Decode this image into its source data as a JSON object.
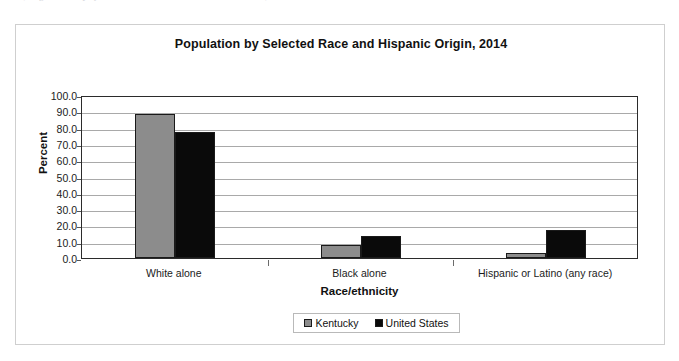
{
  "page": {
    "clipped_header_text": "(Image: Kentucky QuickFacts — U.S. Census Bureau selected data)"
  },
  "chart_data": {
    "type": "bar",
    "title": "Population by Selected Race and Hispanic Origin, 2014",
    "xlabel": "Race/ethnicity",
    "ylabel": "Percent",
    "ylim": [
      0,
      100
    ],
    "ytick_step": 10,
    "grid": true,
    "legend_position": "bottom",
    "categories": [
      "White alone",
      "Black alone",
      "Hispanic or Latino (any race)"
    ],
    "ytick_labels": [
      "0.0",
      "10.0",
      "20.0",
      "30.0",
      "40.0",
      "50.0",
      "60.0",
      "70.0",
      "80.0",
      "90.0",
      "100.0"
    ],
    "series": [
      {
        "name": "Kentucky",
        "color": "#8c8c8c",
        "values": [
          88.3,
          8.2,
          3.3
        ]
      },
      {
        "name": "United States",
        "color": "#0a0a0a",
        "values": [
          77.4,
          13.2,
          17.4
        ]
      }
    ]
  }
}
